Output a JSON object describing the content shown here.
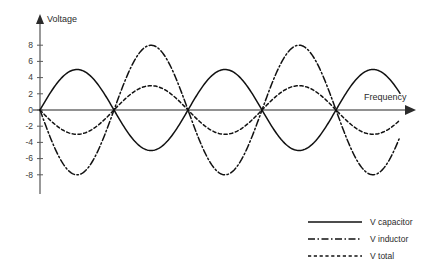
{
  "chart_data": {
    "type": "line",
    "title": "",
    "xlabel": "Frequency",
    "ylabel": "Voltage",
    "grid": false,
    "legend_position": "bottom-right",
    "xlim": [
      0,
      2.45
    ],
    "ylim": [
      -9,
      9
    ],
    "yticks": [
      "8",
      "6",
      "4",
      "2",
      "0",
      "-2",
      "-4",
      "-6",
      "-8"
    ],
    "ytick_values": [
      8,
      6,
      4,
      2,
      0,
      -2,
      -4,
      -6,
      -8
    ],
    "xticks": [],
    "x_unit": "cycles",
    "series": [
      {
        "name": "V capacitor",
        "style": "solid",
        "amplitude": 5,
        "phase_deg": 0,
        "peak": 5,
        "trough": -5
      },
      {
        "name": "V inductor",
        "style": "dash-dot",
        "amplitude": 8,
        "phase_deg": 180,
        "peak": 8,
        "trough": -8
      },
      {
        "name": "V total",
        "style": "dotted",
        "amplitude": 3,
        "phase_deg": 180,
        "peak": 3,
        "trough": -3
      }
    ],
    "colors": {
      "curve": "#111111",
      "axis": "#6d6d6d",
      "text": "#2b2b2b",
      "background": "#ffffff"
    }
  },
  "axes": {
    "y_title": "Voltage",
    "x_title": "Frequency"
  },
  "legend": {
    "items": [
      {
        "label": "V capacitor",
        "style": "solid"
      },
      {
        "label": "V inductor",
        "style": "dash-dot"
      },
      {
        "label": "V total",
        "style": "dotted"
      }
    ]
  }
}
